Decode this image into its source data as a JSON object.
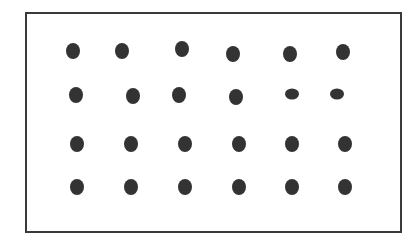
{
  "figure": {
    "rows": 4,
    "columns": 6,
    "frame": {
      "left": 25,
      "top": 12,
      "width": 373,
      "height": 217,
      "border_color": "#3a3a3a"
    },
    "dot_color": "#333333",
    "dots": [
      {
        "row": 1,
        "col": 1,
        "x": 73,
        "y": 51,
        "w": 14,
        "h": 16
      },
      {
        "row": 1,
        "col": 2,
        "x": 122,
        "y": 51,
        "w": 14,
        "h": 16
      },
      {
        "row": 1,
        "col": 3,
        "x": 182,
        "y": 49,
        "w": 14,
        "h": 16
      },
      {
        "row": 1,
        "col": 4,
        "x": 233,
        "y": 54,
        "w": 14,
        "h": 16
      },
      {
        "row": 1,
        "col": 5,
        "x": 290,
        "y": 54,
        "w": 14,
        "h": 16
      },
      {
        "row": 1,
        "col": 6,
        "x": 343,
        "y": 52,
        "w": 14,
        "h": 16
      },
      {
        "row": 2,
        "col": 1,
        "x": 76,
        "y": 95,
        "w": 14,
        "h": 16
      },
      {
        "row": 2,
        "col": 2,
        "x": 133,
        "y": 96,
        "w": 14,
        "h": 16
      },
      {
        "row": 2,
        "col": 3,
        "x": 179,
        "y": 95,
        "w": 14,
        "h": 16
      },
      {
        "row": 2,
        "col": 4,
        "x": 236,
        "y": 97,
        "w": 14,
        "h": 16
      },
      {
        "row": 2,
        "col": 5,
        "x": 292,
        "y": 94,
        "w": 14,
        "h": 11
      },
      {
        "row": 2,
        "col": 6,
        "x": 337,
        "y": 94,
        "w": 14,
        "h": 11
      },
      {
        "row": 3,
        "col": 1,
        "x": 77,
        "y": 144,
        "w": 14,
        "h": 16
      },
      {
        "row": 3,
        "col": 2,
        "x": 131,
        "y": 144,
        "w": 14,
        "h": 16
      },
      {
        "row": 3,
        "col": 3,
        "x": 185,
        "y": 144,
        "w": 14,
        "h": 16
      },
      {
        "row": 3,
        "col": 4,
        "x": 239,
        "y": 144,
        "w": 14,
        "h": 16
      },
      {
        "row": 3,
        "col": 5,
        "x": 292,
        "y": 144,
        "w": 14,
        "h": 16
      },
      {
        "row": 3,
        "col": 6,
        "x": 345,
        "y": 144,
        "w": 14,
        "h": 16
      },
      {
        "row": 4,
        "col": 1,
        "x": 77,
        "y": 187,
        "w": 14,
        "h": 16
      },
      {
        "row": 4,
        "col": 2,
        "x": 131,
        "y": 187,
        "w": 14,
        "h": 16
      },
      {
        "row": 4,
        "col": 3,
        "x": 185,
        "y": 187,
        "w": 14,
        "h": 16
      },
      {
        "row": 4,
        "col": 4,
        "x": 239,
        "y": 187,
        "w": 14,
        "h": 16
      },
      {
        "row": 4,
        "col": 5,
        "x": 292,
        "y": 187,
        "w": 14,
        "h": 16
      },
      {
        "row": 4,
        "col": 6,
        "x": 345,
        "y": 187,
        "w": 14,
        "h": 16
      }
    ]
  }
}
